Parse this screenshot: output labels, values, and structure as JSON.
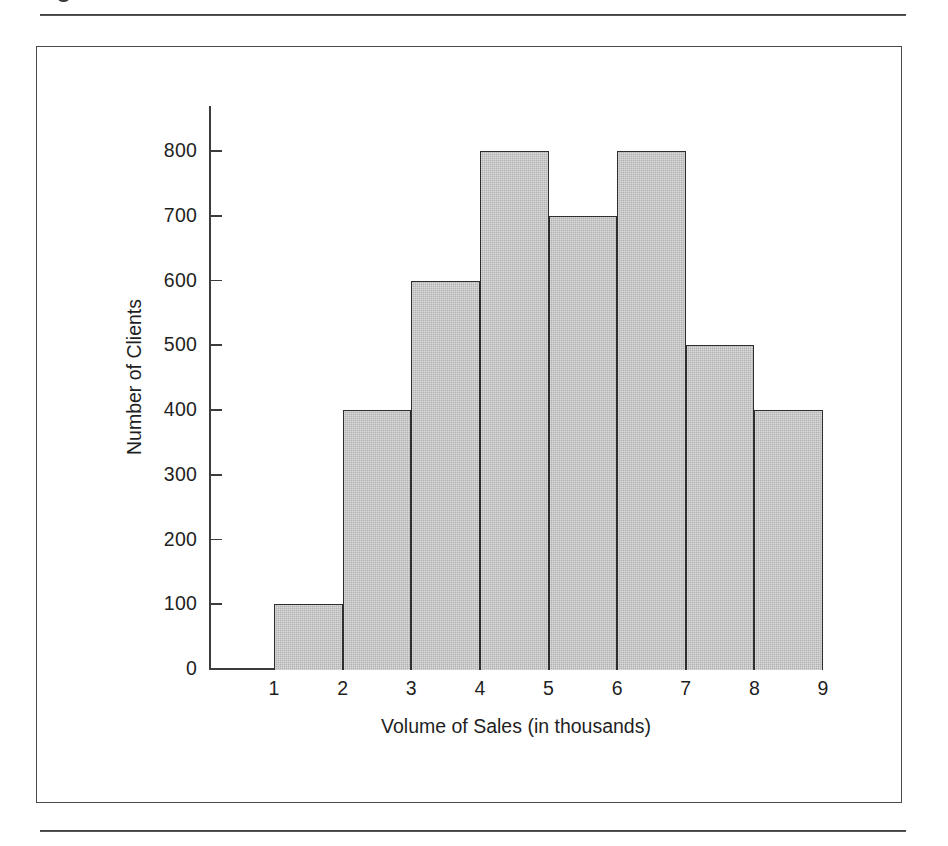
{
  "page": {
    "background_color": "#ffffff",
    "rule_color": "#3a3a3a",
    "top_rule_present": true,
    "bottom_rule_present": true,
    "crop_glyph_present": true
  },
  "figure": {
    "border_color": "#4a4a4a",
    "axis_color": "#3c3c3c",
    "bar_fill_color": "#b2b2b2",
    "bar_stroke_color": "#2e2e2e"
  },
  "chart_data": {
    "type": "bar",
    "title": "",
    "subtitle": "",
    "xlabel": "Volume of Sales (in thousands)",
    "ylabel": "Number of Clients",
    "categories": [
      "1-2",
      "2-3",
      "3-4",
      "4-5",
      "5-6",
      "6-7",
      "7-8",
      "8-9"
    ],
    "bin_edges": [
      1,
      2,
      3,
      4,
      5,
      6,
      7,
      8,
      9
    ],
    "values": [
      100,
      400,
      600,
      800,
      700,
      800,
      500,
      400
    ],
    "x_tick_labels": [
      "1",
      "2",
      "3",
      "4",
      "5",
      "6",
      "7",
      "8",
      "9"
    ],
    "y_tick_labels": [
      "0",
      "100",
      "200",
      "300",
      "400",
      "500",
      "600",
      "700",
      "800"
    ],
    "y_tick_values": [
      0,
      100,
      200,
      300,
      400,
      500,
      600,
      700,
      800
    ],
    "xlim": [
      1,
      9
    ],
    "ylim": [
      0,
      800
    ],
    "grid": false,
    "legend": false,
    "legend_position": "none",
    "bars_contiguous": true,
    "annotations": []
  }
}
